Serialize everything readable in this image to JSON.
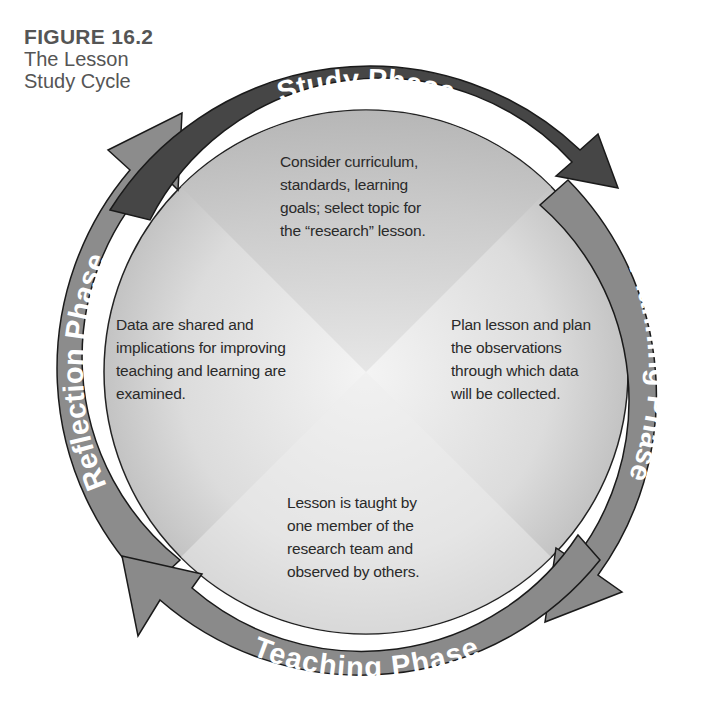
{
  "caption": {
    "figure_number": "FIGURE 16.2",
    "title_line1": "The Lesson",
    "title_line2": "Study Cycle"
  },
  "phases": [
    {
      "id": "study",
      "label": "Study Phase",
      "color": "#4a4a4a",
      "description": [
        "Consider curriculum,",
        "standards, learning",
        "goals; select topic for",
        "the “research” lesson."
      ]
    },
    {
      "id": "planning",
      "label": "Planning Phase",
      "color": "#8a8a8a",
      "description": [
        "Plan lesson and plan",
        "the observations",
        "through which data",
        "will be collected."
      ]
    },
    {
      "id": "teaching",
      "label": "Teaching Phase",
      "color": "#8a8a8a",
      "description": [
        "Lesson is taught by",
        "one member of the",
        "research team and",
        "observed by others."
      ]
    },
    {
      "id": "reflection",
      "label": "Reflection Phase",
      "color": "#8c8c8c",
      "description": [
        "Data are shared and",
        "implications for improving",
        "teaching and learning are",
        "examined."
      ]
    }
  ],
  "cycle_direction": "clockwise"
}
